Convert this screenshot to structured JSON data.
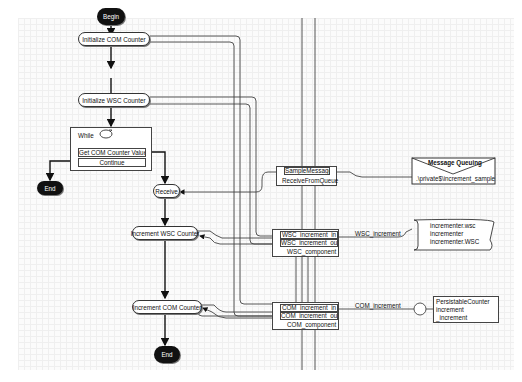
{
  "diagram": {
    "begin": "Begin",
    "init_com": "Initialize COM Counter",
    "init_wsc": "Initialize WSC Counter",
    "while_label": "While",
    "get_com_value": "Get COM Counter Value",
    "continue": "Continue",
    "end_left": "End",
    "receive": "Receive",
    "increment_wsc": "Increment WSC Counter",
    "increment_com": "Increment COM Counter",
    "end_bottom": "End",
    "receive_queue": {
      "port": "SampleMessage",
      "name": "ReceiveFromQueue"
    },
    "message_queuing": {
      "title": "Message Queuing",
      "path": ".\\private$\\increment_sample"
    },
    "wsc_component": {
      "in": "WSC_increment_in",
      "out": "WSC_increment_out",
      "name": "WSC_component",
      "link_label": "WSC_increment"
    },
    "wsc_script": [
      "incrementer.wsc",
      "incrementer",
      "incrementer.WSC"
    ],
    "com_component": {
      "in": "COM_increment_in",
      "out": "COM_increment_out",
      "name": "COM_component",
      "link_label": "COM_increment"
    },
    "com_class": [
      "PersistableCounter",
      "increment",
      "_increment"
    ]
  }
}
